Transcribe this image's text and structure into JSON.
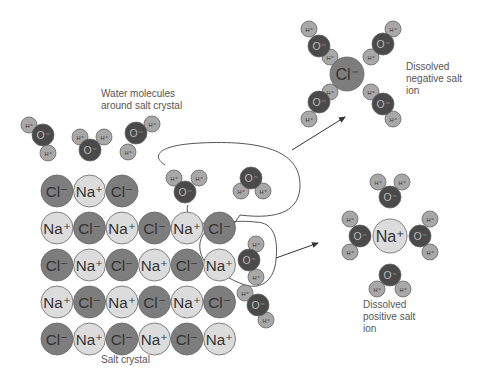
{
  "labels": {
    "water_around": [
      "Water molecules",
      "around salt crystal"
    ],
    "negative_ion": [
      "Dissolved",
      "negative salt",
      "ion"
    ],
    "positive_ion": [
      "Dissolved",
      "positive salt",
      "ion"
    ],
    "salt_crystal": "Salt crystal"
  },
  "atoms": {
    "cl": "Cl⁻",
    "na": "Na⁺",
    "o": "O⁻",
    "h": "H⁺"
  },
  "crystal_rows": [
    [
      "Cl⁻",
      "Na⁺",
      "Cl⁻"
    ],
    [
      "Na⁺",
      "Cl⁻",
      "Na⁺",
      "Cl⁻",
      "Na⁺",
      "Cl⁻"
    ],
    [
      "Cl⁻",
      "Na⁺",
      "Cl⁻",
      "Na⁺",
      "Cl⁻",
      "Na⁺"
    ],
    [
      "Na⁺",
      "Cl⁻",
      "Na⁺",
      "Cl⁻",
      "Na⁺",
      "Cl⁻"
    ],
    [
      "Cl⁻",
      "Na⁺",
      "Cl⁻",
      "Na⁺",
      "Cl⁻",
      "Na⁺"
    ]
  ],
  "colors": {
    "cl": "#7d7d7d",
    "na": "#dcdcdc",
    "o": "#4a4a4a",
    "h": "#a8a8a8",
    "stroke": "#666666",
    "text": "#555555"
  }
}
